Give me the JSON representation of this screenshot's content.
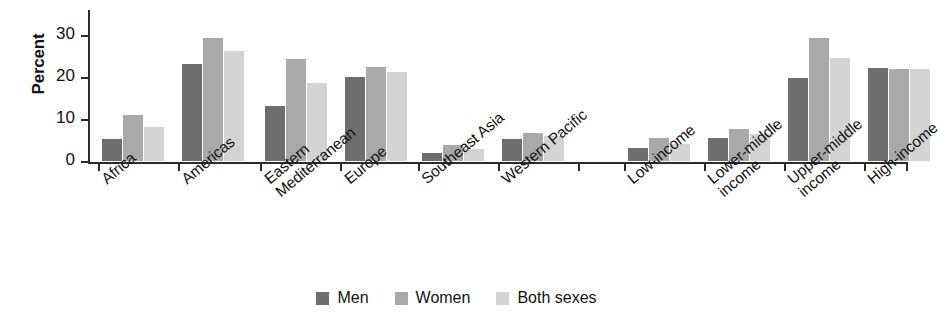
{
  "chart_data": {
    "type": "bar",
    "title": "",
    "subtitle": "",
    "xlabel": "",
    "ylabel": "Percent",
    "ylim": [
      0,
      32
    ],
    "yticks": [
      0,
      10,
      20,
      30
    ],
    "ytick_labels": [
      "0",
      "10",
      "20",
      "30"
    ],
    "grid": false,
    "legend_position": "bottom-center",
    "categories": [
      "Africa",
      "Americas",
      "Eastern Mediterranean",
      "Europe",
      "Southeast Asia",
      "Western Pacific",
      "Low-income",
      "Lower-middle income",
      "Upper-middle income",
      "High-income"
    ],
    "category_lines": [
      [
        "Africa",
        ""
      ],
      [
        "Americas",
        ""
      ],
      [
        "Eastern",
        "Mediterranean"
      ],
      [
        "Europe",
        ""
      ],
      [
        "Southeast Asia",
        ""
      ],
      [
        "Western Pacific",
        ""
      ],
      [
        "Low-income",
        ""
      ],
      [
        "Lower-middle",
        "income"
      ],
      [
        "Upper-middle",
        "income"
      ],
      [
        "High-income",
        ""
      ]
    ],
    "series": [
      {
        "name": "Men",
        "color": "#6e6e6e",
        "values": [
          5.3,
          23.0,
          13.2,
          20.0,
          2.0,
          5.3,
          3.0,
          5.5,
          19.8,
          22.2
        ]
      },
      {
        "name": "Women",
        "color": "#a9a9a9",
        "values": [
          11.0,
          29.4,
          24.3,
          22.4,
          3.9,
          6.6,
          5.5,
          7.6,
          29.2,
          21.9
        ]
      },
      {
        "name": "Both sexes",
        "color": "#d3d3d3",
        "values": [
          8.0,
          26.1,
          18.5,
          21.3,
          2.9,
          6.0,
          4.0,
          6.5,
          24.5,
          22.0
        ]
      }
    ]
  },
  "legend": {
    "items": [
      {
        "label": "Men",
        "color": "#6e6e6e"
      },
      {
        "label": "Women",
        "color": "#a9a9a9"
      },
      {
        "label": "Both sexes",
        "color": "#d3d3d3"
      }
    ]
  },
  "axes": {
    "y_title": "Percent"
  }
}
